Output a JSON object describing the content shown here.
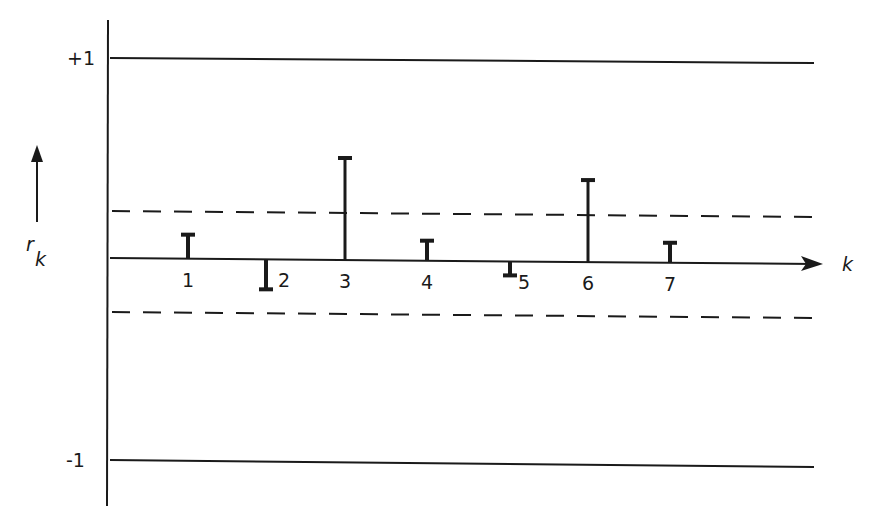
{
  "chart_data": {
    "type": "bar",
    "subtype": "correlogram",
    "title": "",
    "xlabel": "k",
    "ylabel": "r_k",
    "ylabel_main": "r",
    "ylabel_sub": "k",
    "categories": [
      "1",
      "2",
      "3",
      "4",
      "5",
      "6",
      "7"
    ],
    "values": [
      0.12,
      -0.15,
      0.51,
      0.1,
      -0.07,
      0.41,
      0.1
    ],
    "ylim": [
      -1,
      1
    ],
    "ytick_labels": [
      "+1",
      "-1"
    ],
    "reference_lines": [
      {
        "name": "upper-limit",
        "value": 1,
        "style": "solid"
      },
      {
        "name": "upper-confidence-bound",
        "value": 0.25,
        "style": "dashed"
      },
      {
        "name": "lower-confidence-bound",
        "value": -0.25,
        "style": "dashed"
      },
      {
        "name": "lower-limit",
        "value": -1,
        "style": "solid"
      }
    ],
    "grid": false,
    "legend": null
  },
  "colors": {
    "ink": "#1a1a1a",
    "background": "#ffffff"
  }
}
